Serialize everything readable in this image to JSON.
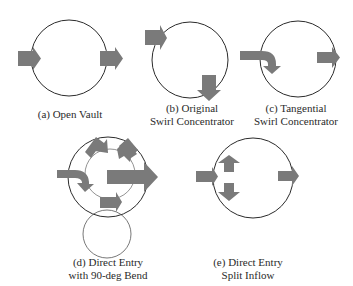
{
  "figure": {
    "colors": {
      "arrow": "#7a7a7a",
      "circle_stroke": "#2b2b2b",
      "inner_circle_stroke": "#555555",
      "background": "#ffffff",
      "text": "#2a2a2a"
    },
    "panels": [
      {
        "id": "a",
        "caption_line1": "(a) Open Vault",
        "caption_line2": ""
      },
      {
        "id": "b",
        "caption_line1": "(b) Original",
        "caption_line2": "Swirl Concentrator"
      },
      {
        "id": "c",
        "caption_line1": "(c) Tangential",
        "caption_line2": "Swirl Concentrator"
      },
      {
        "id": "d",
        "caption_line1": "(d) Direct Entry",
        "caption_line2": "with 90-deg Bend"
      },
      {
        "id": "e",
        "caption_line1": "(e) Direct Entry",
        "caption_line2": "Split Inflow"
      }
    ]
  }
}
